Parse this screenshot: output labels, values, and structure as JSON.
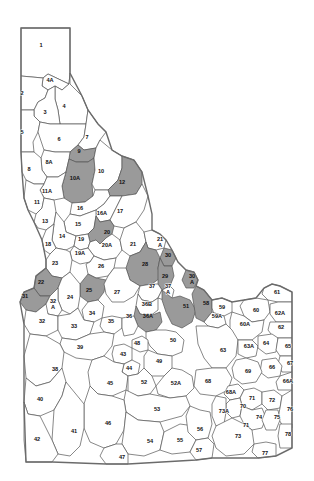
{
  "map": {
    "title": "Idaho Big Game Hunting Unit Map",
    "state_outline_color": "#6b6b6b",
    "unit_fill_color": "#ffffff",
    "shaded_fill_color": "#9a9a9a",
    "border_color": "#555555",
    "background_color": "#ffffff",
    "shaded_units": [
      "9",
      "10A",
      "12",
      "20",
      "22",
      "25",
      "28",
      "29",
      "30",
      "30A",
      "31",
      "36A",
      "51",
      "58"
    ],
    "units": [
      {
        "id": "1",
        "label": "1",
        "x": 41,
        "y": 46,
        "shaded": false
      },
      {
        "id": "4A",
        "label": "4A",
        "x": 50,
        "y": 81,
        "shaded": false
      },
      {
        "id": "2",
        "label": "2",
        "x": 22,
        "y": 94,
        "shaded": false
      },
      {
        "id": "4",
        "label": "4",
        "x": 64,
        "y": 107,
        "shaded": false
      },
      {
        "id": "3",
        "label": "3",
        "x": 45,
        "y": 113,
        "shaded": false
      },
      {
        "id": "5",
        "label": "5",
        "x": 22,
        "y": 133,
        "shaded": false
      },
      {
        "id": "6",
        "label": "6",
        "x": 59,
        "y": 140,
        "shaded": false
      },
      {
        "id": "7",
        "label": "7",
        "x": 87,
        "y": 138,
        "shaded": false
      },
      {
        "id": "9",
        "label": "9",
        "x": 79,
        "y": 152,
        "shaded": true
      },
      {
        "id": "8A",
        "label": "8A",
        "x": 49,
        "y": 163,
        "shaded": false
      },
      {
        "id": "8",
        "label": "8",
        "x": 29,
        "y": 170,
        "shaded": false
      },
      {
        "id": "10A",
        "label": "10A",
        "x": 75,
        "y": 179,
        "shaded": true
      },
      {
        "id": "10",
        "label": "10",
        "x": 101,
        "y": 172,
        "shaded": false
      },
      {
        "id": "12",
        "label": "12",
        "x": 122,
        "y": 183,
        "shaded": true
      },
      {
        "id": "11A",
        "label": "11A",
        "x": 47,
        "y": 192,
        "shaded": false
      },
      {
        "id": "11",
        "label": "11",
        "x": 37,
        "y": 203,
        "shaded": false
      },
      {
        "id": "16",
        "label": "16",
        "x": 80,
        "y": 209,
        "shaded": false
      },
      {
        "id": "16A",
        "label": "16A",
        "x": 102,
        "y": 214,
        "shaded": false
      },
      {
        "id": "17",
        "label": "17",
        "x": 120,
        "y": 212,
        "shaded": false
      },
      {
        "id": "13",
        "label": "13",
        "x": 45,
        "y": 222,
        "shaded": false
      },
      {
        "id": "15",
        "label": "15",
        "x": 78,
        "y": 225,
        "shaded": false
      },
      {
        "id": "20",
        "label": "20",
        "x": 107,
        "y": 233,
        "shaded": true
      },
      {
        "id": "14",
        "label": "14",
        "x": 62,
        "y": 237,
        "shaded": false
      },
      {
        "id": "19",
        "label": "19",
        "x": 81,
        "y": 240,
        "shaded": false
      },
      {
        "id": "18",
        "label": "18",
        "x": 48,
        "y": 245,
        "shaded": false
      },
      {
        "id": "20A",
        "label": "20A",
        "x": 107,
        "y": 246,
        "shaded": false
      },
      {
        "id": "21",
        "label": "21",
        "x": 133,
        "y": 245,
        "shaded": false
      },
      {
        "id": "21A",
        "label": "21 A",
        "x": 160,
        "y": 243,
        "shaded": false
      },
      {
        "id": "19A",
        "label": "19A",
        "x": 80,
        "y": 254,
        "shaded": false
      },
      {
        "id": "30",
        "label": "30",
        "x": 168,
        "y": 256,
        "shaded": true
      },
      {
        "id": "23",
        "label": "23",
        "x": 55,
        "y": 264,
        "shaded": false
      },
      {
        "id": "26",
        "label": "26",
        "x": 101,
        "y": 267,
        "shaded": false
      },
      {
        "id": "28",
        "label": "28",
        "x": 145,
        "y": 265,
        "shaded": true
      },
      {
        "id": "29",
        "label": "29",
        "x": 165,
        "y": 277,
        "shaded": true
      },
      {
        "id": "22",
        "label": "22",
        "x": 41,
        "y": 283,
        "shaded": true
      },
      {
        "id": "25",
        "label": "25",
        "x": 89,
        "y": 291,
        "shaded": true
      },
      {
        "id": "31",
        "label": "31",
        "x": 25,
        "y": 297,
        "shaded": true
      },
      {
        "id": "27",
        "label": "27",
        "x": 117,
        "y": 293,
        "shaded": false
      },
      {
        "id": "37",
        "label": "37",
        "x": 152,
        "y": 287,
        "shaded": false
      },
      {
        "id": "37A",
        "label": "37 A",
        "x": 168,
        "y": 290,
        "shaded": false
      },
      {
        "id": "30A",
        "label": "30 A",
        "x": 192,
        "y": 280,
        "shaded": true
      },
      {
        "id": "61",
        "label": "61",
        "x": 277,
        "y": 293,
        "shaded": false
      },
      {
        "id": "24",
        "label": "24",
        "x": 70,
        "y": 298,
        "shaded": false
      },
      {
        "id": "32A",
        "label": "32 A",
        "x": 53,
        "y": 305,
        "shaded": false
      },
      {
        "id": "36B",
        "label": "36B",
        "x": 147,
        "y": 305,
        "shaded": false
      },
      {
        "id": "51",
        "label": "51",
        "x": 186,
        "y": 307,
        "shaded": true
      },
      {
        "id": "58",
        "label": "58",
        "x": 206,
        "y": 304,
        "shaded": true
      },
      {
        "id": "59",
        "label": "59",
        "x": 222,
        "y": 308,
        "shaded": false
      },
      {
        "id": "34",
        "label": "34",
        "x": 92,
        "y": 314,
        "shaded": false
      },
      {
        "id": "36A",
        "label": "36A",
        "x": 148,
        "y": 317,
        "shaded": true
      },
      {
        "id": "59A",
        "label": "59A",
        "x": 217,
        "y": 317,
        "shaded": false
      },
      {
        "id": "60",
        "label": "60",
        "x": 256,
        "y": 311,
        "shaded": false
      },
      {
        "id": "62A",
        "label": "62A",
        "x": 280,
        "y": 314,
        "shaded": false
      },
      {
        "id": "35",
        "label": "35",
        "x": 111,
        "y": 322,
        "shaded": false
      },
      {
        "id": "60A",
        "label": "60A",
        "x": 245,
        "y": 325,
        "shaded": false
      },
      {
        "id": "62",
        "label": "62",
        "x": 281,
        "y": 328,
        "shaded": false
      },
      {
        "id": "32",
        "label": "32",
        "x": 42,
        "y": 322,
        "shaded": false
      },
      {
        "id": "33",
        "label": "33",
        "x": 74,
        "y": 327,
        "shaded": false
      },
      {
        "id": "36",
        "label": "36",
        "x": 129,
        "y": 317,
        "shaded": false
      },
      {
        "id": "50",
        "label": "50",
        "x": 173,
        "y": 341,
        "shaded": false
      },
      {
        "id": "63",
        "label": "63",
        "x": 223,
        "y": 351,
        "shaded": false
      },
      {
        "id": "63A",
        "label": "63A",
        "x": 249,
        "y": 347,
        "shaded": false
      },
      {
        "id": "64",
        "label": "64",
        "x": 266,
        "y": 344,
        "shaded": false
      },
      {
        "id": "65",
        "label": "65",
        "x": 288,
        "y": 347,
        "shaded": false
      },
      {
        "id": "39",
        "label": "39",
        "x": 80,
        "y": 348,
        "shaded": false
      },
      {
        "id": "43",
        "label": "43",
        "x": 123,
        "y": 355,
        "shaded": false
      },
      {
        "id": "49",
        "label": "49",
        "x": 159,
        "y": 362,
        "shaded": false
      },
      {
        "id": "48",
        "label": "48",
        "x": 137,
        "y": 344,
        "shaded": false
      },
      {
        "id": "44",
        "label": "44",
        "x": 129,
        "y": 369,
        "shaded": false
      },
      {
        "id": "67",
        "label": "67",
        "x": 290,
        "y": 364,
        "shaded": false
      },
      {
        "id": "66",
        "label": "66",
        "x": 272,
        "y": 368,
        "shaded": false
      },
      {
        "id": "69",
        "label": "69",
        "x": 248,
        "y": 372,
        "shaded": false
      },
      {
        "id": "38",
        "label": "38",
        "x": 55,
        "y": 370,
        "shaded": false
      },
      {
        "id": "45",
        "label": "45",
        "x": 110,
        "y": 384,
        "shaded": false
      },
      {
        "id": "52",
        "label": "52",
        "x": 144,
        "y": 383,
        "shaded": false
      },
      {
        "id": "52A",
        "label": "52A",
        "x": 176,
        "y": 384,
        "shaded": false
      },
      {
        "id": "68",
        "label": "68",
        "x": 208,
        "y": 382,
        "shaded": false
      },
      {
        "id": "66A",
        "label": "66A",
        "x": 288,
        "y": 382,
        "shaded": false
      },
      {
        "id": "68A",
        "label": "68A",
        "x": 231,
        "y": 393,
        "shaded": false
      },
      {
        "id": "71",
        "label": "71",
        "x": 252,
        "y": 399,
        "shaded": false
      },
      {
        "id": "72",
        "label": "72",
        "x": 272,
        "y": 401,
        "shaded": false
      },
      {
        "id": "40",
        "label": "40",
        "x": 40,
        "y": 400,
        "shaded": false
      },
      {
        "id": "70",
        "label": "70",
        "x": 243,
        "y": 407,
        "shaded": false
      },
      {
        "id": "73A",
        "label": "73A",
        "x": 224,
        "y": 412,
        "shaded": false
      },
      {
        "id": "53",
        "label": "53",
        "x": 157,
        "y": 410,
        "shaded": false
      },
      {
        "id": "46",
        "label": "46",
        "x": 108,
        "y": 424,
        "shaded": false
      },
      {
        "id": "76",
        "label": "76",
        "x": 290,
        "y": 410,
        "shaded": false
      },
      {
        "id": "74",
        "label": "74",
        "x": 259,
        "y": 418,
        "shaded": false
      },
      {
        "id": "75",
        "label": "75",
        "x": 277,
        "y": 418,
        "shaded": false
      },
      {
        "id": "71b",
        "label": "71",
        "x": 246,
        "y": 426,
        "shaded": false
      },
      {
        "id": "41",
        "label": "41",
        "x": 74,
        "y": 432,
        "shaded": false
      },
      {
        "id": "42",
        "label": "42",
        "x": 37,
        "y": 440,
        "shaded": false
      },
      {
        "id": "54",
        "label": "54",
        "x": 150,
        "y": 442,
        "shaded": false
      },
      {
        "id": "55",
        "label": "55",
        "x": 180,
        "y": 441,
        "shaded": false
      },
      {
        "id": "56",
        "label": "56",
        "x": 200,
        "y": 430,
        "shaded": false
      },
      {
        "id": "73",
        "label": "73",
        "x": 238,
        "y": 437,
        "shaded": false
      },
      {
        "id": "78",
        "label": "78",
        "x": 288,
        "y": 435,
        "shaded": false
      },
      {
        "id": "47",
        "label": "47",
        "x": 122,
        "y": 458,
        "shaded": false
      },
      {
        "id": "57",
        "label": "57",
        "x": 199,
        "y": 451,
        "shaded": false
      },
      {
        "id": "77",
        "label": "77",
        "x": 265,
        "y": 454,
        "shaded": false
      }
    ]
  }
}
